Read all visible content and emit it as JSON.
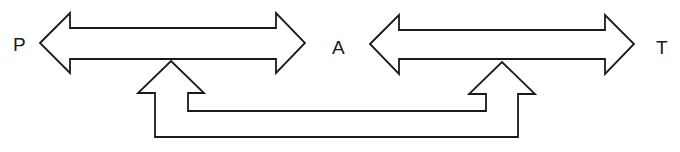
{
  "diagram": {
    "title": "",
    "nodes": [
      {
        "id": "P",
        "label": "P"
      },
      {
        "id": "A",
        "label": "A"
      },
      {
        "id": "T",
        "label": "T"
      }
    ],
    "edges": [
      {
        "from": "P",
        "to": "A",
        "type": "bidirectional-block-arrow"
      },
      {
        "from": "A",
        "to": "T",
        "type": "bidirectional-block-arrow"
      },
      {
        "from": "P-A-link",
        "to": "A-T-link",
        "type": "u-shaped-block-arrow",
        "note": "two upward arrowheads pointing into both horizontal arrows, joined below"
      }
    ],
    "colors": {
      "stroke": "#1a1a1a",
      "fill": "#ffffff",
      "background": "#ffffff"
    }
  },
  "labels": {
    "p": "P",
    "a": "A",
    "t": "T"
  }
}
